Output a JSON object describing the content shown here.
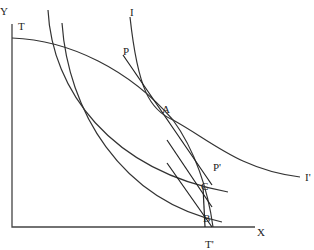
{
  "diagram": {
    "type": "economics trade equilibrium diagram",
    "axes": {
      "y_label": "Y",
      "x_label": "X"
    },
    "curves": {
      "transformation_start_label": "T",
      "transformation_end_label": "T'",
      "indifference_top_label": "I",
      "indifference_end_label": "I'",
      "price_line_start_label": "P",
      "price_line_end_label": "P'"
    },
    "points": {
      "a": "A",
      "b": "B",
      "c": "C"
    },
    "colors": {
      "line": "#333333",
      "background": "#ffffff"
    }
  }
}
